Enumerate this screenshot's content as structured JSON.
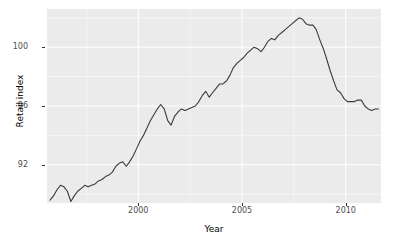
{
  "chart_data": {
    "type": "line",
    "title": "",
    "subtitle": "",
    "xlabel": "Year",
    "ylabel": "Retail index",
    "grid": true,
    "legend": false,
    "legend_position": "none",
    "xlim": [
      1995.6,
      1011.7
    ],
    "ylim": [
      89.4,
      102.6
    ],
    "xticks": [
      2000,
      2005,
      2010
    ],
    "xtick_labels": [
      "2000",
      "2005",
      "2010"
    ],
    "yticks": [
      92,
      96,
      100
    ],
    "ytick_labels": [
      "92",
      "96",
      "100"
    ],
    "line_color": "#3b3b3b",
    "panel_color": "#ebebeb",
    "grid_color": "#ffffff",
    "series": [
      {
        "name": "Retail index",
        "x": [
          1995.75,
          1995.92,
          1996.08,
          1996.25,
          1996.42,
          1996.58,
          1996.75,
          1996.92,
          1997.08,
          1997.25,
          1997.42,
          1997.58,
          1997.75,
          1997.92,
          1998.08,
          1998.25,
          1998.42,
          1998.58,
          1998.75,
          1998.92,
          1999.08,
          1999.25,
          1999.42,
          1999.58,
          1999.75,
          1999.92,
          2000.08,
          2000.25,
          2000.42,
          2000.58,
          2000.75,
          2000.92,
          2001.08,
          2001.25,
          2001.42,
          2001.58,
          2001.75,
          2001.92,
          2002.08,
          2002.25,
          2002.42,
          2002.58,
          2002.75,
          2002.92,
          2003.08,
          2003.25,
          2003.42,
          2003.58,
          2003.75,
          2003.92,
          2004.08,
          2004.25,
          2004.42,
          2004.58,
          2004.75,
          2004.92,
          2005.08,
          2005.25,
          2005.42,
          2005.58,
          2005.75,
          2005.92,
          2006.08,
          2006.25,
          2006.42,
          2006.58,
          2006.75,
          2006.92,
          2007.08,
          2007.25,
          2007.42,
          2007.58,
          2007.75,
          2007.92,
          2008.08,
          2008.25,
          2008.42,
          2008.58,
          2008.75,
          2008.92,
          2009.08,
          2009.25,
          2009.42,
          2009.58,
          2009.75,
          2009.92,
          2010.08,
          2010.25,
          2010.42,
          2010.58,
          2010.75,
          2010.92,
          2011.08,
          2011.25,
          2011.42,
          2011.58
        ],
        "y": [
          89.6,
          89.9,
          90.3,
          90.6,
          90.5,
          90.2,
          89.5,
          89.9,
          90.2,
          90.4,
          90.6,
          90.5,
          90.6,
          90.7,
          90.9,
          91.0,
          91.2,
          91.3,
          91.5,
          91.9,
          92.1,
          92.2,
          91.9,
          92.2,
          92.6,
          93.1,
          93.6,
          94.0,
          94.5,
          95.0,
          95.4,
          95.8,
          96.1,
          95.8,
          95.0,
          94.7,
          95.3,
          95.6,
          95.8,
          95.7,
          95.8,
          95.9,
          96.0,
          96.3,
          96.7,
          97.0,
          96.6,
          96.9,
          97.2,
          97.5,
          97.5,
          97.7,
          98.1,
          98.6,
          98.9,
          99.1,
          99.3,
          99.6,
          99.8,
          100.0,
          99.9,
          99.7,
          100.0,
          100.4,
          100.6,
          100.5,
          100.8,
          101.0,
          101.2,
          101.4,
          101.6,
          101.8,
          102.0,
          101.9,
          101.6,
          101.5,
          101.5,
          101.2,
          100.5,
          99.9,
          99.2,
          98.4,
          97.7,
          97.1,
          96.9,
          96.5,
          96.3,
          96.3,
          96.3,
          96.4,
          96.4,
          96.0,
          95.8,
          95.7,
          95.8,
          95.8
        ]
      }
    ],
    "annotations": []
  },
  "axes": {
    "y_title": "Retail index",
    "x_title": "Year",
    "y_ticks": [
      {
        "label": "100",
        "value": 100
      },
      {
        "label": "96",
        "value": 96
      },
      {
        "label": "92",
        "value": 92
      }
    ],
    "x_ticks": [
      {
        "label": "2000",
        "value": 2000
      },
      {
        "label": "2005",
        "value": 2005
      },
      {
        "label": "2010",
        "value": 2010
      }
    ]
  }
}
